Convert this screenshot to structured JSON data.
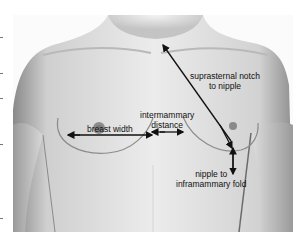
{
  "figure": {
    "type": "anatomical-measurement-diagram",
    "background": "#ffffff",
    "annotation_color": "#111111"
  },
  "labels": {
    "sn_nipple_line1": "suprasternal notch",
    "sn_nipple_line2": "to nipple",
    "intermammary_line1": "intermammary",
    "intermammary_line2": "distance",
    "breast_width": "breast width",
    "nipple_imf_line1": "nipple to",
    "nipple_imf_line2": "inframammary fold"
  },
  "measurements": [
    {
      "name": "suprasternal notch to nipple",
      "type": "diagonal-arrow"
    },
    {
      "name": "intermammary distance",
      "type": "double-arrow"
    },
    {
      "name": "breast width",
      "type": "double-arrow"
    },
    {
      "name": "nipple to inframammary fold",
      "type": "vertical-arrow"
    }
  ]
}
